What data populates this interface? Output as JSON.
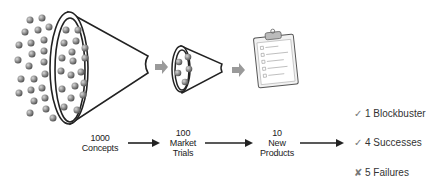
{
  "stages": [
    {
      "count": "1000",
      "line1": "Concepts",
      "line2": ""
    },
    {
      "count": "100",
      "line1": "Market",
      "line2": "Trials"
    },
    {
      "count": "10",
      "line1": "New",
      "line2": "Products"
    }
  ],
  "outcomes": [
    {
      "mark": "✓",
      "label": "1 Blockbuster"
    },
    {
      "mark": "✓",
      "label": "4 Successes"
    },
    {
      "mark": "✘",
      "label": "5 Failures"
    }
  ],
  "colors": {
    "outline": "#222222",
    "ball": "#8a8a8a",
    "process_arrow": "#9a9a9a",
    "text": "#222222",
    "check": "#777777"
  }
}
